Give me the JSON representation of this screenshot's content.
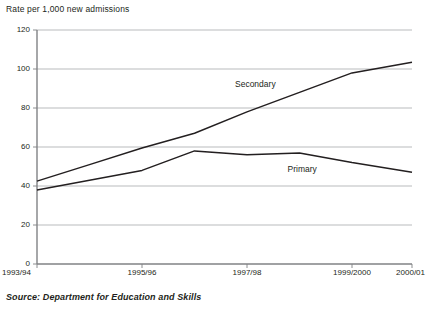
{
  "chart_data": {
    "type": "line",
    "title": "Rate per 1,000 new admissions",
    "xlabel": "",
    "ylabel": "Rate per 1,000 new admissions",
    "ylim": [
      0,
      120
    ],
    "ytick_values": [
      0,
      20,
      40,
      60,
      80,
      100,
      120
    ],
    "ytick_labels": [
      "0",
      "20",
      "40",
      "60",
      "80",
      "100",
      "120"
    ],
    "grid": true,
    "legend_position": "inline-labels",
    "x": [
      "1993/94",
      "1994/95",
      "1995/96",
      "1996/97",
      "1997/98",
      "1998/99",
      "1999/2000",
      "2000/01"
    ],
    "xtick_labels": [
      "1993/94",
      "1995/96",
      "1997/98",
      "1999/2000",
      "2000/01"
    ],
    "series": [
      {
        "name": "Secondary",
        "values": [
          42.5,
          51,
          59.5,
          67,
          78,
          88,
          98,
          103.5
        ],
        "color": "#231f20"
      },
      {
        "name": "Primary",
        "values": [
          38,
          43,
          48,
          58,
          56,
          57,
          52,
          47
        ],
        "color": "#231f20"
      }
    ],
    "annotations": [
      {
        "text": "Secondary",
        "x": "1997/98",
        "y": 92
      },
      {
        "text": "Primary",
        "x": "1998/99",
        "y": 48
      }
    ]
  },
  "source": {
    "label": "Source: Department for Education and Skills"
  },
  "colors": {
    "line": "#231f20",
    "grid": "#a7a9ac",
    "axis": "#808285",
    "text": "#231f20",
    "background": "#ffffff"
  }
}
